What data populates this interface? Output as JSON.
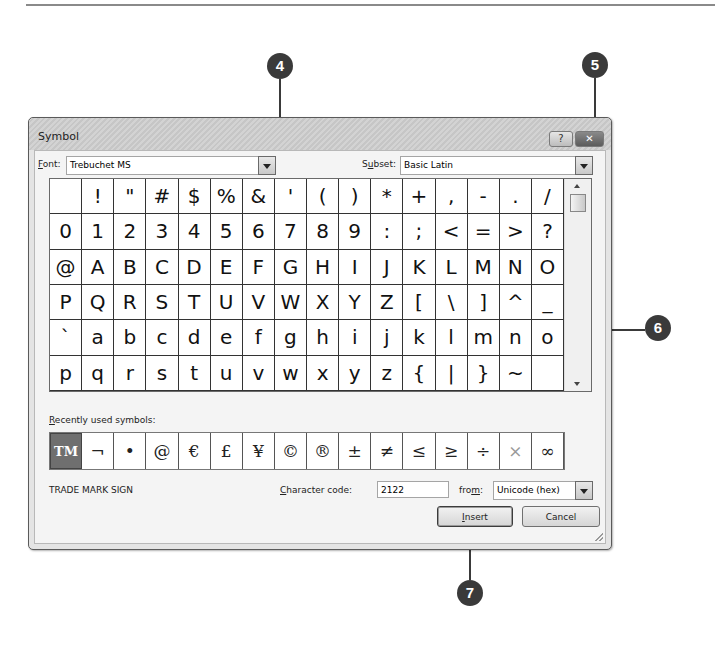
{
  "dialog": {
    "title": "Symbol",
    "help_label": "?",
    "close_label": "✕",
    "font_label_u": "F",
    "font_label_rest": "ont:",
    "font_value": "Trebuchet MS",
    "subset_label_pre": "S",
    "subset_label_u": "u",
    "subset_label_rest": "bset:",
    "subset_value": "Basic Latin",
    "grid_rows": [
      [
        " ",
        "!",
        "\"",
        "#",
        "$",
        "%",
        "&",
        "'",
        "(",
        ")",
        "*",
        "+",
        ",",
        "-",
        ".",
        "/"
      ],
      [
        "0",
        "1",
        "2",
        "3",
        "4",
        "5",
        "6",
        "7",
        "8",
        "9",
        ":",
        ";",
        "<",
        "=",
        ">",
        "?"
      ],
      [
        "@",
        "A",
        "B",
        "C",
        "D",
        "E",
        "F",
        "G",
        "H",
        "I",
        "J",
        "K",
        "L",
        "M",
        "N",
        "O"
      ],
      [
        "P",
        "Q",
        "R",
        "S",
        "T",
        "U",
        "V",
        "W",
        "X",
        "Y",
        "Z",
        "[",
        "\\",
        "]",
        "^",
        "_"
      ],
      [
        "`",
        "a",
        "b",
        "c",
        "d",
        "e",
        "f",
        "g",
        "h",
        "i",
        "j",
        "k",
        "l",
        "m",
        "n",
        "o"
      ],
      [
        "p",
        "q",
        "r",
        "s",
        "t",
        "u",
        "v",
        "w",
        "x",
        "y",
        "z",
        "{",
        "|",
        "}",
        "~",
        " "
      ]
    ],
    "recent_label_u": "R",
    "recent_label_rest": "ecently used symbols:",
    "recent_symbols": [
      "TM",
      "¬",
      "•",
      "@",
      "€",
      "£",
      "¥",
      "©",
      "®",
      "±",
      "≠",
      "≤",
      "≥",
      "÷",
      "×",
      "∞"
    ],
    "char_name": "TRADE MARK SIGN",
    "char_code_label_u": "C",
    "char_code_label_rest": "haracter code:",
    "char_code_value": "2122",
    "from_label_pre": "fro",
    "from_label_u": "m",
    "from_label_rest": ":",
    "from_value": "Unicode (hex)",
    "insert_label_u": "I",
    "insert_label_rest": "nsert",
    "cancel_label": "Cancel"
  },
  "callouts": [
    "4",
    "5",
    "6",
    "7"
  ]
}
